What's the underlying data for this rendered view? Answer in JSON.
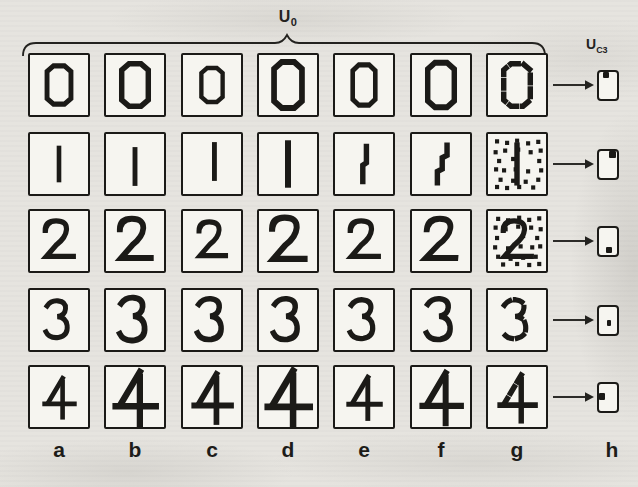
{
  "labels": {
    "u0": {
      "base": "U",
      "sub": "0"
    },
    "uc3": {
      "base": "U",
      "sub": "C3"
    }
  },
  "figure": {
    "column_labels": [
      "a",
      "b",
      "c",
      "d",
      "e",
      "f",
      "g",
      "h"
    ],
    "rows": [
      {
        "digit": "0",
        "cells": [
          {
            "variant": "normal",
            "s": 0.9
          },
          {
            "variant": "normal",
            "s": 1.0
          },
          {
            "variant": "normal",
            "s": 0.8
          },
          {
            "variant": "normal",
            "s": 1.05,
            "sy": 1.08
          },
          {
            "variant": "normal",
            "s": 0.95,
            "sx": 0.85
          },
          {
            "variant": "normal",
            "s": 1.0,
            "sy": 1.05
          },
          {
            "variant": "dashed",
            "s": 1.0
          }
        ],
        "response_mark": {
          "pos": "top-center",
          "x": 0.25,
          "y": 0.0,
          "w": 0.32,
          "h": 0.24
        }
      },
      {
        "digit": "1",
        "cells": [
          {
            "variant": "normal",
            "s": 0.85
          },
          {
            "variant": "normal",
            "s": 0.9,
            "dy": 2
          },
          {
            "variant": "normal",
            "s": 0.9,
            "dx": 2,
            "dy": -2
          },
          {
            "variant": "normal",
            "s": 1.1
          },
          {
            "variant": "bent",
            "glyph": "one_bent",
            "s": 1.0
          },
          {
            "variant": "zigzag",
            "glyph": "one_zig",
            "s": 1.0
          },
          {
            "variant": "noisy",
            "s": 1.0
          }
        ],
        "response_mark": {
          "pos": "top-right",
          "x": 0.6,
          "y": 0.0,
          "w": 0.4,
          "h": 0.3
        }
      },
      {
        "digit": "2",
        "cells": [
          {
            "variant": "normal",
            "s": 0.95
          },
          {
            "variant": "normal",
            "s": 1.05
          },
          {
            "variant": "normal",
            "s": 0.9
          },
          {
            "variant": "normal",
            "s": 1.1
          },
          {
            "variant": "normal",
            "s": 0.95
          },
          {
            "variant": "slanted",
            "s": 1.05,
            "sk": -5
          },
          {
            "variant": "noisy",
            "s": 0.95
          }
        ],
        "response_mark": {
          "pos": "bottom-center-right",
          "x": 0.42,
          "y": 0.74,
          "w": 0.32,
          "h": 0.26
        }
      },
      {
        "digit": "3",
        "cells": [
          {
            "variant": "normal",
            "s": 0.9
          },
          {
            "variant": "normal",
            "s": 1.05
          },
          {
            "variant": "normal",
            "s": 1.0
          },
          {
            "variant": "normal",
            "s": 1.0
          },
          {
            "variant": "normal",
            "s": 0.95
          },
          {
            "variant": "normal",
            "s": 1.0
          },
          {
            "variant": "dashed",
            "s": 0.95
          }
        ],
        "response_mark": {
          "pos": "center-dot",
          "x": 0.46,
          "y": 0.5,
          "w": 0.27,
          "h": 0.24
        }
      },
      {
        "digit": "4",
        "cells": [
          {
            "variant": "normal",
            "s": 0.85
          },
          {
            "variant": "normal",
            "s": 1.15
          },
          {
            "variant": "normal",
            "s": 1.05
          },
          {
            "variant": "normal",
            "s": 1.2
          },
          {
            "variant": "normal",
            "s": 0.9
          },
          {
            "variant": "normal",
            "s": 1.1
          },
          {
            "variant": "dashed-diagonal",
            "glyph": "four_dg",
            "s": 1.0
          }
        ],
        "response_mark": {
          "pos": "middle-left",
          "x": 0.0,
          "y": 0.36,
          "w": 0.34,
          "h": 0.28
        }
      }
    ]
  },
  "noise_dots": [
    [
      0.1,
      0.05
    ],
    [
      0.3,
      0.08
    ],
    [
      0.52,
      0.03
    ],
    [
      0.72,
      0.07
    ],
    [
      0.92,
      0.04
    ],
    [
      0.05,
      0.22
    ],
    [
      0.25,
      0.25
    ],
    [
      0.5,
      0.2
    ],
    [
      0.76,
      0.22
    ],
    [
      0.95,
      0.25
    ],
    [
      0.08,
      0.42
    ],
    [
      0.6,
      0.38
    ],
    [
      0.88,
      0.42
    ],
    [
      0.04,
      0.6
    ],
    [
      0.3,
      0.62
    ],
    [
      0.55,
      0.58
    ],
    [
      0.78,
      0.6
    ],
    [
      0.94,
      0.58
    ],
    [
      0.1,
      0.78
    ],
    [
      0.35,
      0.82
    ],
    [
      0.6,
      0.8
    ],
    [
      0.85,
      0.78
    ],
    [
      0.2,
      0.93
    ],
    [
      0.48,
      0.92
    ],
    [
      0.72,
      0.94
    ],
    [
      0.92,
      0.92
    ]
  ],
  "colors": {
    "ink": "#1b1a17",
    "paper": "#e6e4df",
    "cell": "#f6f5f0"
  }
}
